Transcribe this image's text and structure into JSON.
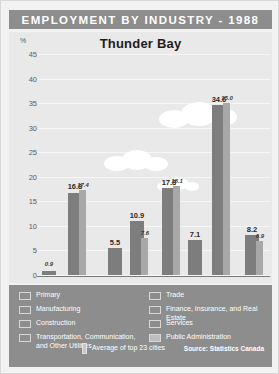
{
  "banner": {
    "title": "EMPLOYMENT BY INDUSTRY - 1988"
  },
  "chart": {
    "title": "Thunder Bay",
    "axis_unit": "%"
  },
  "legend": {
    "items": [
      {
        "label": "Primary",
        "color": "#9e9e9e"
      },
      {
        "label": "Manufacturing",
        "color": "#9e9e9e"
      },
      {
        "label": "Construction",
        "color": "#9e9e9e"
      },
      {
        "label": "Transportation, Communication, and Other Utilities",
        "color": "#9e9e9e"
      },
      {
        "label": "Trade",
        "color": "#9e9e9e"
      },
      {
        "label": "Finance, Insurance, and Real Estate",
        "color": "#9e9e9e"
      },
      {
        "label": "Services",
        "color": "#9e9e9e"
      },
      {
        "label": "Public Administration",
        "color": "#bdbdbd"
      }
    ],
    "average_label": "Average of top 23 cities",
    "source": "Source: Statistics Canada"
  },
  "chart_data": {
    "type": "bar",
    "title": "Thunder Bay",
    "xlabel": "",
    "ylabel": "%",
    "ylim": [
      0,
      45
    ],
    "yticks": [
      0,
      5,
      10,
      15,
      20,
      25,
      30,
      35,
      40,
      45
    ],
    "grid": true,
    "legend_position": "bottom",
    "categories": [
      "Primary",
      "Manufacturing",
      "Construction",
      "Transportation, Communication, and Other Utilities",
      "Trade",
      "Finance, Insurance, and Real Estate",
      "Services",
      "Public Administration"
    ],
    "series": [
      {
        "name": "Thunder Bay",
        "color": "#7d7d7d",
        "values": [
          0.9,
          16.8,
          5.5,
          10.9,
          17.8,
          7.1,
          34.6,
          8.2
        ]
      },
      {
        "name": "Average of top 23 cities",
        "color": "#a8a8a8",
        "values": [
          null,
          17.4,
          null,
          7.6,
          18.1,
          null,
          35.0,
          6.9
        ]
      }
    ],
    "data_labels": {
      "city": [
        "0.9",
        "16.8",
        "5.5",
        "10.9",
        "17.8",
        "7.1",
        "34.6",
        "8.2"
      ],
      "average": [
        "",
        "17.4",
        "",
        "7.6",
        "18.1",
        "",
        "35.0",
        "6.9"
      ]
    }
  }
}
